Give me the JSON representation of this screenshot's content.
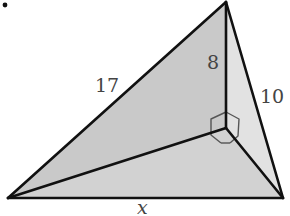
{
  "diagram": {
    "type": "triangular pyramid (tetrahedron) with perpendicular altitude",
    "colors": {
      "edge": "#111111",
      "left_face": "#c9c9c9",
      "right_face": "#e2e2e2",
      "bottom_face": "#d2d2d2",
      "right_angle_marker": "#555555",
      "label": "#444444"
    },
    "labels": {
      "slant_edge": "17",
      "altitude": "8",
      "right_edge": "10",
      "base_edge": "x"
    },
    "markers": {
      "right_angle": "right-angle-marker"
    }
  }
}
